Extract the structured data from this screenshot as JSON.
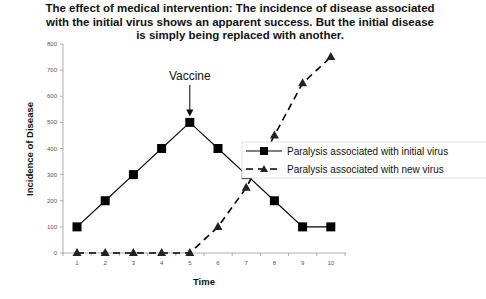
{
  "chart_data": {
    "type": "line",
    "title": "The effect of medical intervention: The incidence of disease associated with the initial virus shows an apparent success. But the initial disease is simply being replaced with another.",
    "xlabel": "Time",
    "ylabel": "Incidence of Disease",
    "x": [
      1,
      2,
      3,
      4,
      5,
      6,
      7,
      8,
      9,
      10
    ],
    "x_tick_labels": [
      "1",
      "2",
      "3",
      "4",
      "5",
      "6",
      "7",
      "8",
      "9",
      "10"
    ],
    "y_tick_labels": [
      "0",
      "100",
      "200",
      "300",
      "400",
      "500",
      "600",
      "700",
      "800"
    ],
    "ylim": [
      0,
      800
    ],
    "grid": false,
    "legend_position": "right-center",
    "series": [
      {
        "name": "Paralysis associated with initial virus",
        "values": [
          100,
          200,
          300,
          400,
          500,
          400,
          300,
          200,
          100,
          100
        ],
        "line_style": "solid",
        "marker": "square",
        "color": "#000000"
      },
      {
        "name": "Paralysis associated with new virus",
        "values": [
          0,
          0,
          0,
          0,
          0,
          100,
          250,
          450,
          650,
          750
        ],
        "line_style": "dashed",
        "marker": "triangle",
        "color": "#000000"
      }
    ],
    "annotations": [
      {
        "text": "Vaccine",
        "x": 5,
        "arrow_to_y": 500
      }
    ]
  }
}
